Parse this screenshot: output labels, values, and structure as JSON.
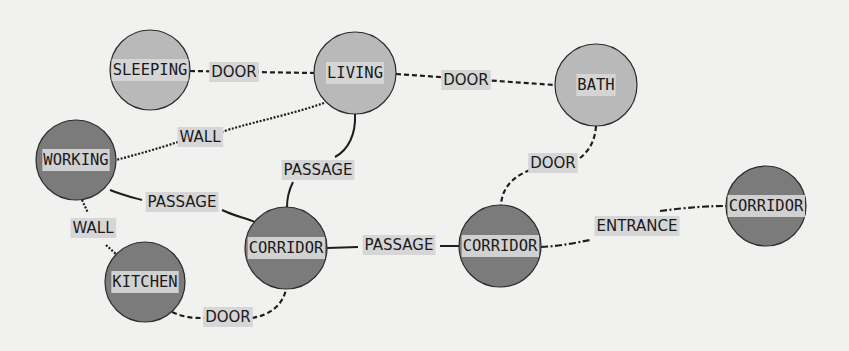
{
  "diagram": {
    "type": "room-adjacency-graph",
    "colors": {
      "background": "#f1f1f0",
      "node_light": "#b9b9b9",
      "node_dark": "#7b7b7b",
      "node_stroke": "#2b2b2b",
      "label_bg": "#d6d6d6",
      "edge": "#1e1e1e"
    },
    "nodes": [
      {
        "id": "sleeping",
        "label": "SLEEPING",
        "x": 150,
        "y": 70,
        "r": 40,
        "tone": "light"
      },
      {
        "id": "living",
        "label": "LIVING",
        "x": 355,
        "y": 73,
        "r": 41,
        "tone": "light"
      },
      {
        "id": "bath",
        "label": "BATH",
        "x": 596,
        "y": 85,
        "r": 41,
        "tone": "light"
      },
      {
        "id": "working",
        "label": "WORKING",
        "x": 76,
        "y": 160,
        "r": 40,
        "tone": "dark"
      },
      {
        "id": "kitchen",
        "label": "KITCHEN",
        "x": 145,
        "y": 282,
        "r": 40,
        "tone": "dark"
      },
      {
        "id": "corridor_1",
        "label": "CORRIDOR",
        "x": 286,
        "y": 248,
        "r": 41,
        "tone": "dark"
      },
      {
        "id": "corridor_2",
        "label": "CORRIDOR",
        "x": 500,
        "y": 246,
        "r": 41,
        "tone": "dark"
      },
      {
        "id": "corridor_3",
        "label": "CORRIDOR",
        "x": 766,
        "y": 206,
        "r": 40,
        "tone": "dark"
      }
    ],
    "edges": [
      {
        "id": "e1",
        "from": "sleeping",
        "to": "living",
        "label": "DOOR",
        "style": "dashed",
        "lx": 234,
        "ly": 72,
        "path": "M190,71 L315,73"
      },
      {
        "id": "e2",
        "from": "living",
        "to": "bath",
        "label": "DOOR",
        "style": "dashed",
        "lx": 466,
        "ly": 80,
        "path": "M396,74 L555,85"
      },
      {
        "id": "e3",
        "from": "living",
        "to": "working",
        "label": "WALL",
        "style": "dotted",
        "lx": 200,
        "ly": 137,
        "path": "M324,103 C290,115 240,125 222,132 M178,142 C160,148 135,155 116,160"
      },
      {
        "id": "e4",
        "from": "living",
        "to": "corridor_1",
        "label": "PASSAGE",
        "style": "solid",
        "lx": 318,
        "ly": 170,
        "path": "M355,114 C356,135 348,150 335,157 M293,182 C289,190 287,198 287,207"
      },
      {
        "id": "e5",
        "from": "working",
        "to": "corridor_1",
        "label": "PASSAGE",
        "style": "solid",
        "lx": 182,
        "ly": 202,
        "path": "M110,190 C125,196 135,198 142,200 M222,210 C232,215 245,218 255,222"
      },
      {
        "id": "e6",
        "from": "working",
        "to": "kitchen",
        "label": "WALL",
        "style": "dotted",
        "lx": 93,
        "ly": 228,
        "path": "M82,200 L88,213 M106,245 L116,254"
      },
      {
        "id": "e7",
        "from": "kitchen",
        "to": "corridor_1",
        "label": "DOOR",
        "style": "dashed",
        "lx": 228,
        "ly": 317,
        "path": "M172,312 C185,318 196,318 205,318 M252,318 C270,315 283,305 286,289"
      },
      {
        "id": "e8",
        "from": "corridor_1",
        "to": "corridor_2",
        "label": "PASSAGE",
        "style": "solid",
        "lx": 399,
        "ly": 245,
        "path": "M327,248 L358,247 M440,246 L459,246"
      },
      {
        "id": "e9",
        "from": "bath",
        "to": "corridor_2",
        "label": "DOOR",
        "style": "dashed",
        "lx": 553,
        "ly": 163,
        "path": "M596,126 C595,140 590,150 580,158 M530,170 C510,178 502,190 501,205"
      },
      {
        "id": "e10",
        "from": "corridor_2",
        "to": "corridor_3",
        "label": "ENTRANCE",
        "style": "dashdot",
        "lx": 637,
        "ly": 226,
        "path": "M541,247 C560,246 575,243 590,240 M660,211 C690,207 710,206 726,206"
      }
    ]
  }
}
